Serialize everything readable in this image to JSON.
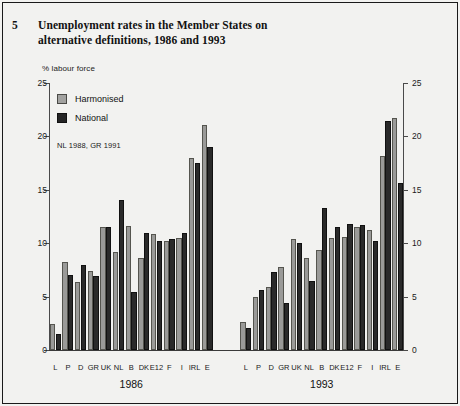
{
  "figure": {
    "number": "5",
    "title_line1": "Unemployment rates in the Member States on",
    "title_line2": "alternative definitions, 1986 and 1993"
  },
  "legend": {
    "harmonised_label": "Harmonised",
    "national_label": "National",
    "note": "NL 1988, GR 1991",
    "harmonised_color": "#9a9a98",
    "national_color": "#2a2a2a"
  },
  "axis": {
    "unit_label": "% labour force",
    "ticks": [
      "0",
      "5",
      "10",
      "15",
      "20",
      "25"
    ]
  },
  "groups": [
    {
      "label": "1986"
    },
    {
      "label": "1993"
    }
  ],
  "chart_data": {
    "type": "bar",
    "title": "Unemployment rates in the Member States on alternative definitions, 1986 and 1993",
    "subtitle": "NL 1988, GR 1991",
    "xlabel": "",
    "ylabel": "% labour force",
    "ylim": [
      0,
      25
    ],
    "yticks": [
      0,
      5,
      10,
      15,
      20,
      25
    ],
    "grid": false,
    "legend_position": "top-left",
    "legend": [
      "Harmonised",
      "National"
    ],
    "panels": [
      {
        "name": "1986",
        "categories": [
          "L",
          "P",
          "D",
          "GR",
          "UK",
          "NL",
          "B",
          "DK",
          "E12",
          "F",
          "I",
          "IRL",
          "E"
        ],
        "series": [
          {
            "name": "Harmonised",
            "values": [
              2.4,
              8.2,
              6.4,
              7.4,
              11.5,
              9.2,
              11.6,
              8.6,
              10.9,
              10.2,
              10.5,
              18.0,
              21.1
            ]
          },
          {
            "name": "National",
            "values": [
              1.5,
              7.0,
              8.0,
              6.9,
              11.5,
              14.0,
              5.4,
              11.0,
              10.2,
              10.4,
              11.0,
              17.5,
              19.0
            ]
          }
        ]
      },
      {
        "name": "1993",
        "categories": [
          "L",
          "P",
          "D",
          "GR",
          "UK",
          "NL",
          "B",
          "DK",
          "E12",
          "F",
          "I",
          "IRL",
          "E"
        ],
        "series": [
          {
            "name": "Harmonised",
            "values": [
              2.6,
              5.0,
              5.9,
              7.8,
              10.4,
              8.6,
              9.4,
              10.5,
              10.6,
              11.5,
              11.2,
              18.2,
              21.7
            ]
          },
          {
            "name": "National",
            "values": [
              2.1,
              5.6,
              7.3,
              4.4,
              10.0,
              6.5,
              13.3,
              11.5,
              11.8,
              11.7,
              10.2,
              21.4,
              15.6
            ]
          }
        ]
      }
    ]
  }
}
